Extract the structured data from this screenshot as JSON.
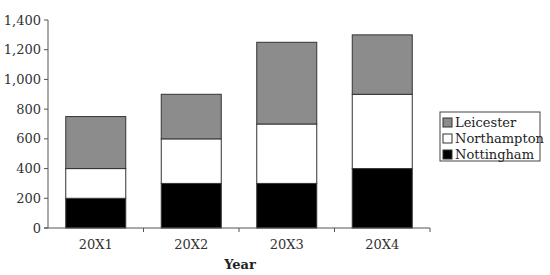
{
  "chart_data": {
    "type": "bar",
    "stacked": true,
    "title": "",
    "xlabel": "Year",
    "ylabel": "",
    "categories": [
      "20X1",
      "20X2",
      "20X3",
      "20X4"
    ],
    "series": [
      {
        "name": "Nottingham",
        "color": "#000000",
        "values": [
          200,
          300,
          300,
          400
        ]
      },
      {
        "name": "Northampton",
        "color": "#ffffff",
        "values": [
          200,
          300,
          400,
          500
        ]
      },
      {
        "name": "Leicester",
        "color": "#8c8c8c",
        "values": [
          350,
          300,
          550,
          400
        ]
      }
    ],
    "totals": [
      750,
      900,
      1250,
      1300
    ],
    "ylim": [
      0,
      1400
    ],
    "yticks": [
      "0",
      "200",
      "400",
      "600",
      "800",
      "1,000",
      "1,200",
      "1,400"
    ],
    "grid": false,
    "legend_position": "right",
    "legend_order": [
      "Leicester",
      "Northampton",
      "Nottingham"
    ]
  }
}
